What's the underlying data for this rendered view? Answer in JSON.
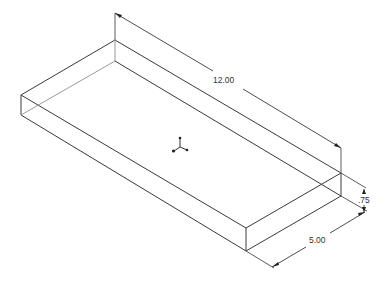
{
  "drawing": {
    "type": "isometric-part-view",
    "part": "rectangular-plate",
    "colors": {
      "background": "#ffffff",
      "edge": "#3a3a3a",
      "hidden_edge": "#9a9a9a",
      "dimension": "#333333"
    },
    "dimensions": {
      "length": {
        "label": "12.00"
      },
      "height": {
        "label": ".75"
      },
      "width": {
        "label": "5.00"
      }
    },
    "origin": {
      "label": "origin-triad"
    }
  }
}
